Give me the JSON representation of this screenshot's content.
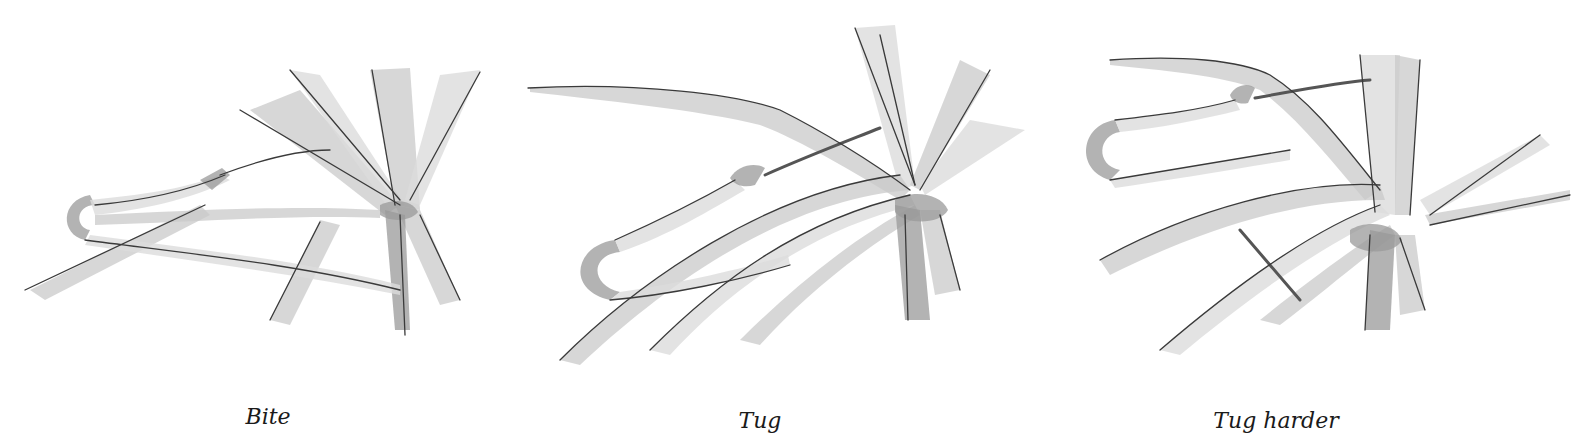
{
  "figure": {
    "panels": [
      {
        "id": "bite",
        "caption": "Bite",
        "description": "Grass-stem snare loop with bait end gripped at the knot"
      },
      {
        "id": "tug",
        "caption": "Tug",
        "description": "Loop pulled; stem slides through the tied grass bundle"
      },
      {
        "id": "tug-harder",
        "caption": "Tug harder",
        "description": "Loop tightened further; grass blades spread from the knot"
      }
    ],
    "style": {
      "palette": [
        "#ffffff",
        "#dcdcdc",
        "#c9c9c9",
        "#9a9a9a",
        "#3a3a3a"
      ]
    }
  }
}
